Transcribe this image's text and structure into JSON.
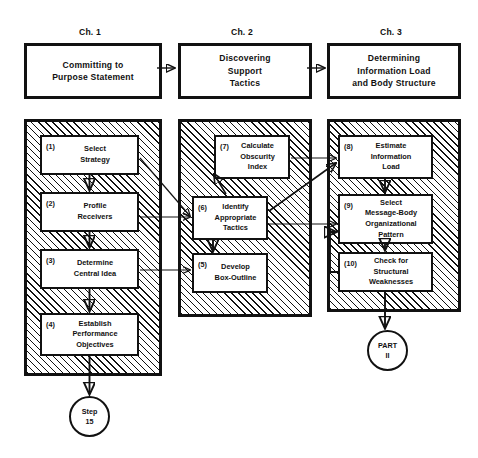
{
  "diagram": {
    "chapters": [
      {
        "label": "Ch. 1",
        "title": "Committing to\nPurpose Statement"
      },
      {
        "label": "Ch. 2",
        "title": "Discovering\nSupport\nTactics"
      },
      {
        "label": "Ch. 3",
        "title": "Determining\nInformation Load\nand Body Structure"
      }
    ],
    "columns": [
      {
        "name": "left-column",
        "steps": [
          {
            "num": "(1)",
            "text": "Select\nStrategy"
          },
          {
            "num": "(2)",
            "text": "Profile\nReceivers"
          },
          {
            "num": "(3)",
            "text": "Determine\nCentral Idea"
          },
          {
            "num": "(4)",
            "text": "Establish\nPerformance\nObjectives"
          }
        ]
      },
      {
        "name": "middle-column",
        "steps": [
          {
            "num": "(7)",
            "text": "Calculate\nObscurity\nIndex"
          },
          {
            "num": "(6)",
            "text": "Identify\nAppropriate\nTactics"
          },
          {
            "num": "(5)",
            "text": "Develop\nBox-Outline"
          }
        ]
      },
      {
        "name": "right-column",
        "steps": [
          {
            "num": "(8)",
            "text": "Estimate\nInformation\nLoad"
          },
          {
            "num": "(9)",
            "text": "Select\nMessage-Body\nOrganizational\nPattern"
          },
          {
            "num": "(10)",
            "text": "Check for\nStructural\nWeaknesses"
          }
        ]
      }
    ],
    "terminators": [
      {
        "name": "step-15-terminator",
        "text": "Step\n15"
      },
      {
        "name": "part-ii-terminator",
        "text": "PART\nII"
      }
    ],
    "colors": {
      "ink": "#111111",
      "paper": "#ffffff"
    }
  }
}
